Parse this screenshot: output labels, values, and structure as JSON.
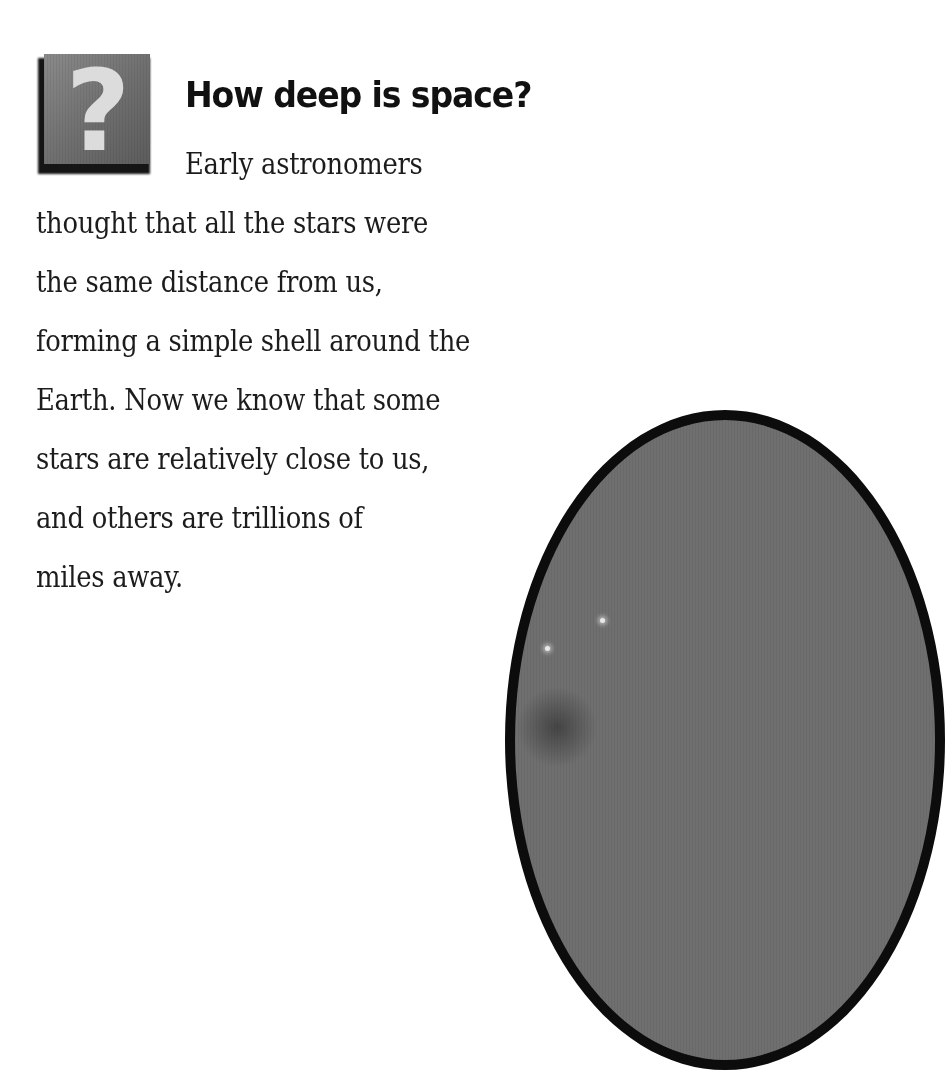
{
  "icon": {
    "name": "question-mark-icon",
    "glyph": "?"
  },
  "heading": "How deep is space?",
  "body_lines": [
    "Early astronomers",
    "thought that all the stars were",
    "the same distance from us,",
    "forming a simple shell around the",
    "Earth. Now we know that some",
    "stars are relatively close to us,",
    "and others are trillions of",
    "miles away."
  ],
  "illustration": {
    "name": "space-planet-illustration",
    "border_color": "#0c0c0c",
    "fill_color": "#6f6f6f"
  }
}
